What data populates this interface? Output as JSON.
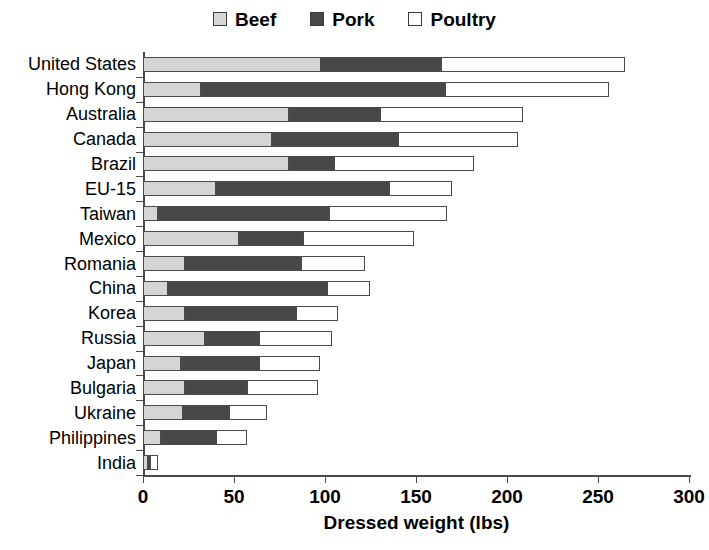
{
  "legend": {
    "items": [
      {
        "label": "Beef",
        "color": "#d5d5d5"
      },
      {
        "label": "Pork",
        "color": "#474747"
      },
      {
        "label": "Poultry",
        "color": "#ffffff"
      }
    ]
  },
  "axis": {
    "x_title": "Dressed weight (lbs)",
    "x_ticks": [
      "0",
      "50",
      "100",
      "150",
      "200",
      "250",
      "300"
    ]
  },
  "chart_data": {
    "type": "bar",
    "orientation": "horizontal",
    "stacked": true,
    "title": "",
    "xlabel": "Dressed weight (lbs)",
    "ylabel": "",
    "xlim": [
      0,
      300
    ],
    "xticks": [
      0,
      50,
      100,
      150,
      200,
      250,
      300
    ],
    "grid": false,
    "legend_position": "top-center",
    "categories": [
      "United States",
      "Hong Kong",
      "Australia",
      "Canada",
      "Brazil",
      "EU-15",
      "Taiwan",
      "Mexico",
      "Romania",
      "China",
      "Korea",
      "Russia",
      "Japan",
      "Bulgaria",
      "Ukraine",
      "Philippines",
      "India"
    ],
    "series": [
      {
        "name": "Beef",
        "color": "#d5d5d5",
        "values": [
          98,
          32,
          80,
          71,
          80,
          40,
          8,
          53,
          23,
          14,
          23,
          34,
          21,
          23,
          22,
          10,
          3
        ]
      },
      {
        "name": "Pork",
        "color": "#474747",
        "values": [
          66,
          134,
          50,
          69,
          25,
          95,
          94,
          35,
          64,
          87,
          61,
          30,
          43,
          34,
          25,
          30,
          1
        ]
      },
      {
        "name": "Poultry",
        "color": "#ffffff",
        "values": [
          101,
          90,
          79,
          66,
          77,
          35,
          65,
          61,
          35,
          24,
          23,
          40,
          33,
          39,
          21,
          17,
          4
        ]
      }
    ],
    "totals": [
      265,
      256,
      209,
      206,
      182,
      170,
      167,
      149,
      122,
      125,
      107,
      104,
      97,
      96,
      68,
      57,
      8
    ]
  }
}
